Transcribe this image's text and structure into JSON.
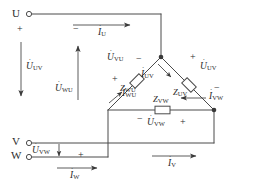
{
  "diagram": {
    "line_color": "#4a4a4a",
    "text_color": "#2b2b2b"
  },
  "terminals": [
    {
      "id": "U",
      "label": "U"
    },
    {
      "id": "V",
      "label": "V"
    },
    {
      "id": "W",
      "label": "W"
    }
  ],
  "signs": {
    "u_plus": "+",
    "u_minus": "−",
    "vu_minus": "−",
    "vu_plus": "+",
    "uv_plus": "+",
    "uv_minus": "−",
    "vw_minus": "−",
    "vw_plus": "+",
    "vw_left_plus": "+"
  },
  "voltages": [
    {
      "name": "U_UV_left",
      "symbol": "U",
      "sub": "UV",
      "direction": "down"
    },
    {
      "name": "U_WU_left",
      "symbol": "U",
      "sub": "WU",
      "direction": "up"
    },
    {
      "name": "U_VU_branch",
      "symbol": "U",
      "sub": "VU",
      "direction": "none"
    },
    {
      "name": "U_UV_branch",
      "symbol": "U",
      "sub": "UV",
      "direction": "none"
    },
    {
      "name": "U_VW_branch",
      "symbol": "U",
      "sub": "VW",
      "direction": "none"
    },
    {
      "name": "U_VW_left",
      "symbol": "U",
      "sub": "VW",
      "direction": "down"
    }
  ],
  "currents": [
    {
      "name": "I_U",
      "symbol": "I",
      "sub": "U",
      "direction": "right"
    },
    {
      "name": "I_V",
      "symbol": "I",
      "sub": "V",
      "direction": "right"
    },
    {
      "name": "I_W",
      "symbol": "I",
      "sub": "W",
      "direction": "right"
    },
    {
      "name": "I_UV",
      "symbol": "I",
      "sub": "UV",
      "direction": "down-right"
    },
    {
      "name": "I_WU",
      "symbol": "I",
      "sub": "WU",
      "direction": "up-right"
    },
    {
      "name": "I_VW",
      "symbol": "I",
      "sub": "VW",
      "direction": "left"
    }
  ],
  "impedances": [
    {
      "name": "Z_WU",
      "symbol": "Z",
      "sub": "WU"
    },
    {
      "name": "Z_UV",
      "symbol": "Z",
      "sub": "UV"
    },
    {
      "name": "Z_VW",
      "symbol": "Z",
      "sub": "VW"
    }
  ]
}
